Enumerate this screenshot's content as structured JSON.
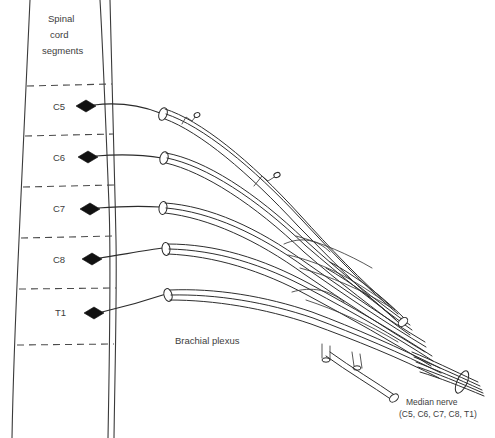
{
  "figure": {
    "title_lines": [
      "Spinal",
      "cord",
      "segments"
    ],
    "title_line_1": "Spinal",
    "title_line_2": "cord",
    "title_line_3": "segments",
    "plexus_label": "Brachial plexus",
    "median_nerve_label": "Median nerve",
    "median_nerve_roots": "(C5, C6, C7, C8, T1)",
    "colors": {
      "background": "#ffffff",
      "outline": "#3a3a3a",
      "divider": "#4a4a4a",
      "nerve": "#2e2e2e",
      "marker": "#111111",
      "text": "#3d3d3d"
    }
  },
  "segments": [
    {
      "label": "C5",
      "label_x": 62,
      "label_y": 110,
      "marker_x": 86,
      "marker_y": 106
    },
    {
      "label": "C6",
      "label_x": 62,
      "label_y": 161,
      "marker_x": 88,
      "marker_y": 157
    },
    {
      "label": "C7",
      "label_x": 62,
      "label_y": 212,
      "marker_x": 90,
      "marker_y": 209
    },
    {
      "label": "C8",
      "label_x": 62,
      "label_y": 263,
      "marker_x": 92,
      "marker_y": 259
    },
    {
      "label": "T1",
      "label_x": 62,
      "label_y": 314,
      "marker_x": 94,
      "marker_y": 313
    }
  ],
  "dividers": [
    {
      "x1": 28,
      "y1": 86,
      "x2": 112,
      "y2": 84
    },
    {
      "x1": 26,
      "y1": 136,
      "x2": 113,
      "y2": 134
    },
    {
      "x1": 24,
      "y1": 187,
      "x2": 114,
      "y2": 185
    },
    {
      "x1": 22,
      "y1": 238,
      "x2": 115,
      "y2": 236
    },
    {
      "x1": 20,
      "y1": 289,
      "x2": 116,
      "y2": 288
    },
    {
      "x1": 18,
      "y1": 345,
      "x2": 114,
      "y2": 344
    }
  ],
  "cord": {
    "left_edge": "M30,0 C26,60 22,160 18,250 C15,310 13,380 12,438",
    "right_edge": "M110,0 C112,60 114,160 116,250 C117,300 115,360 114,438",
    "inner_edge": "M100,0 C104,60 108,150 112,230 C114,280 112,330 110,438"
  },
  "nerve_labels": {
    "plexus_x": 175,
    "plexus_y": 344,
    "median_x": 404,
    "median_y": 404,
    "median_roots_x": 398,
    "median_roots_y": 416
  }
}
